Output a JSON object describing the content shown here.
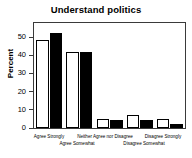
{
  "chart_data": {
    "type": "bar",
    "title": "Understand politics",
    "xlabel": "",
    "ylabel": "Percent",
    "categories": [
      "Agree Strongly",
      "Agree Somewhat",
      "Neither Agree nor Disagree",
      "Disagree Somewhat",
      "Disagree Strongly"
    ],
    "series": [
      {
        "name": "white",
        "color": "#ffffff",
        "values": [
          46,
          40,
          4.5,
          7,
          4.5
        ]
      },
      {
        "name": "black",
        "color": "#000000",
        "values": [
          50,
          40,
          4,
          4,
          2
        ]
      }
    ],
    "ylim": [
      0,
      55
    ],
    "yticks": [
      0,
      10,
      20,
      30,
      40,
      50
    ],
    "ytick_labels": [
      "0",
      "10",
      "20",
      "30",
      "40",
      "50"
    ],
    "grid": false,
    "legend": "none",
    "axis_color": "#3a3a3a"
  },
  "axis": {
    "tick0": "0",
    "tick1": "10",
    "tick2": "20",
    "tick3": "30",
    "tick4": "40",
    "tick5": "50"
  },
  "xlabels": {
    "g1_top": "Agree Strongly",
    "g2_bottom": "Agree Somewhat",
    "g3_top": "Neither Agree nor Disagree",
    "g4_bottom": "Disagree Somewhat",
    "g5_top": "Disagree Strongly"
  }
}
